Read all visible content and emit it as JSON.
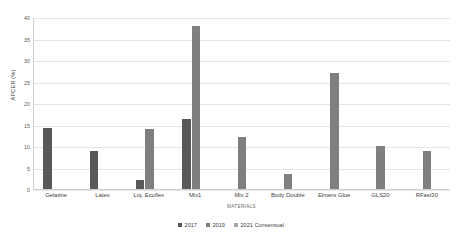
{
  "chart_data": {
    "type": "bar",
    "title": "",
    "xlabel": "MATERIALS",
    "ylabel": "APCER (%)",
    "ylim": [
      0,
      40
    ],
    "ytick_labels": [
      "40",
      "35",
      "30",
      "25",
      "20",
      "15",
      "10",
      "5",
      "0"
    ],
    "yticks": [
      40,
      35,
      30,
      25,
      20,
      15,
      10,
      5,
      0
    ],
    "grid": true,
    "legend_position": "bottom",
    "categories": [
      "Gelatine",
      "Latex",
      "Liq. Ecoflex",
      "Mix1",
      "Mix 2",
      "Body Double",
      "Elmers Glue",
      "GLS20",
      "RFast30"
    ],
    "series": [
      {
        "name": "2017",
        "color": "#595959",
        "values": [
          14.1,
          8.8,
          2.0,
          16.2,
          0,
          0,
          0,
          0,
          0
        ]
      },
      {
        "name": "2019",
        "color": "#7f7f7f",
        "values": [
          0,
          0,
          14.0,
          38.0,
          12.0,
          3.4,
          27.0,
          9.9,
          8.8
        ]
      },
      {
        "name": "2021 Consensual",
        "color": "#a6a6a6",
        "values": [
          0,
          0,
          0,
          0,
          0,
          0,
          0,
          0,
          0
        ]
      }
    ]
  }
}
